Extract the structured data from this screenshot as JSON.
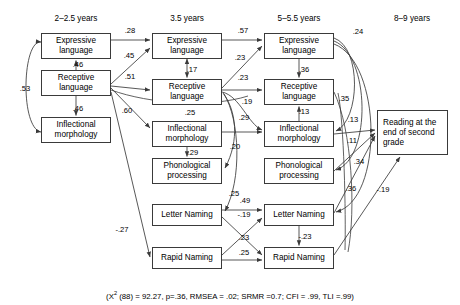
{
  "figure": {
    "type": "path-diagram",
    "columns": [
      {
        "id": "c1",
        "label": "2–2.5 years",
        "cx": 76
      },
      {
        "id": "c2",
        "label": "3.5 years",
        "cx": 187
      },
      {
        "id": "c3",
        "label": "5–5.5 years",
        "cx": 299
      },
      {
        "id": "c4",
        "label": "8–9 years",
        "cx": 412
      }
    ],
    "nodes": [
      {
        "id": "n1e",
        "label": "Expressive language",
        "x": 41,
        "y": 33,
        "w": 70,
        "h": 26,
        "col": "c1"
      },
      {
        "id": "n1r",
        "label": "Receptive language",
        "x": 41,
        "y": 70,
        "w": 70,
        "h": 26,
        "col": "c1"
      },
      {
        "id": "n1i",
        "label": "Inflectional morphology",
        "x": 41,
        "y": 117,
        "w": 70,
        "h": 26,
        "col": "c1"
      },
      {
        "id": "n2e",
        "label": "Expressive language",
        "x": 152,
        "y": 33,
        "w": 70,
        "h": 26,
        "col": "c2"
      },
      {
        "id": "n2r",
        "label": "Receptive language",
        "x": 152,
        "y": 79,
        "w": 70,
        "h": 26,
        "col": "c2"
      },
      {
        "id": "n2i",
        "label": "Inflectional morphology",
        "x": 152,
        "y": 121,
        "w": 70,
        "h": 26,
        "col": "c2"
      },
      {
        "id": "n2p",
        "label": "Phonological processing",
        "x": 152,
        "y": 158,
        "w": 70,
        "h": 26,
        "col": "c2"
      },
      {
        "id": "n2l",
        "label": "Letter Naming",
        "x": 152,
        "y": 204,
        "w": 70,
        "h": 22,
        "col": "c2"
      },
      {
        "id": "n2n",
        "label": "Rapid Naming",
        "x": 152,
        "y": 247,
        "w": 70,
        "h": 22,
        "col": "c2"
      },
      {
        "id": "n3e",
        "label": "Expressive language",
        "x": 264,
        "y": 33,
        "w": 70,
        "h": 26,
        "col": "c3"
      },
      {
        "id": "n3r",
        "label": "Receptive language",
        "x": 264,
        "y": 79,
        "w": 70,
        "h": 26,
        "col": "c3"
      },
      {
        "id": "n3i",
        "label": "Inflectional morphology",
        "x": 264,
        "y": 121,
        "w": 70,
        "h": 26,
        "col": "c3"
      },
      {
        "id": "n3p",
        "label": "Phonological processing",
        "x": 264,
        "y": 158,
        "w": 70,
        "h": 26,
        "col": "c3"
      },
      {
        "id": "n3l",
        "label": "Letter Naming",
        "x": 264,
        "y": 204,
        "w": 70,
        "h": 22,
        "col": "c3"
      },
      {
        "id": "n3n",
        "label": "Rapid Naming",
        "x": 264,
        "y": 247,
        "w": 70,
        "h": 22,
        "col": "c3"
      },
      {
        "id": "n4",
        "label": "Reading at the end of second grade",
        "x": 377,
        "y": 110,
        "w": 71,
        "h": 45,
        "col": "c4"
      }
    ],
    "paths": [
      {
        "from": "n1r",
        "to": "n1e",
        "coef": ".46",
        "lx": 74,
        "ly": 64,
        "style": "single"
      },
      {
        "from": "n1r",
        "to": "n1i",
        "coef": ".46",
        "lx": 74,
        "ly": 108,
        "style": "single"
      },
      {
        "from": "n1e",
        "to": "n1i",
        "coef": ".53",
        "lx": 25,
        "ly": 88,
        "style": "double-curve"
      },
      {
        "from": "n1e",
        "to": "n2e",
        "coef": ".28",
        "lx": 130,
        "ly": 30,
        "style": "straight"
      },
      {
        "from": "n1r",
        "to": "n2e",
        "coef": ".45",
        "lx": 129,
        "ly": 56,
        "style": "straight"
      },
      {
        "from": "n1r",
        "to": "n2r",
        "coef": ".51",
        "lx": 130,
        "ly": 77,
        "style": "straight"
      },
      {
        "from": "n1r",
        "to": "n2i",
        "coef": ".60",
        "lx": 127,
        "ly": 110,
        "style": "straight"
      },
      {
        "from": "n1r",
        "to": "n2n",
        "coef": ".25",
        "lx": 190,
        "ly": 112,
        "style": "curve"
      },
      {
        "from": "n1r",
        "to": "n2n",
        "coef": "-.27",
        "lx": 122,
        "ly": 229,
        "style": "straight"
      },
      {
        "from": "n2e",
        "to": "n2r",
        "coef": ".17",
        "lx": 191,
        "ly": 69,
        "style": "double"
      },
      {
        "from": "n2i",
        "to": "n2p",
        "coef": ".29",
        "lx": 192,
        "ly": 152,
        "style": "single"
      },
      {
        "from": "n2e",
        "to": "n3e",
        "coef": ".57",
        "lx": 243,
        "ly": 30,
        "style": "straight"
      },
      {
        "from": "n2r",
        "to": "n3e",
        "coef": ".23",
        "lx": 240,
        "ly": 57,
        "style": "straight"
      },
      {
        "from": "n2r",
        "to": "n3r",
        "coef": ".23",
        "lx": 243,
        "ly": 77,
        "style": "straight"
      },
      {
        "from": "n2r",
        "to": "n3i",
        "coef": ".19",
        "lx": 246,
        "ly": 101,
        "style": "curve"
      },
      {
        "from": "n2i",
        "to": "n3i",
        "coef": ".29",
        "lx": 243,
        "ly": 117,
        "style": "straight"
      },
      {
        "from": "n2r",
        "to": "n2p",
        "coef": ".20",
        "lx": 234,
        "ly": 146,
        "style": "curve"
      },
      {
        "from": "n2r",
        "to": "n2l",
        "coef": ".25",
        "lx": 233,
        "ly": 193,
        "style": "curve"
      },
      {
        "from": "n2l",
        "to": "n3l",
        "coef": ".49",
        "lx": 243,
        "ly": 199,
        "style": "straight"
      },
      {
        "from": "n2l",
        "to": "n3n",
        "coef": "-.19",
        "lx": 243,
        "ly": 213,
        "style": "straight"
      },
      {
        "from": "n2n",
        "to": "n3l",
        "coef": ".23",
        "lx": 243,
        "ly": 237,
        "style": "straight"
      },
      {
        "from": "n2n",
        "to": "n3n",
        "coef": ".25",
        "lx": 243,
        "ly": 252,
        "style": "straight"
      },
      {
        "from": "n3e",
        "to": "n3r",
        "coef": ".36",
        "lx": 303,
        "ly": 69,
        "style": "single"
      },
      {
        "from": "n3i",
        "to": "n3r",
        "coef": ".13",
        "lx": 303,
        "ly": 111,
        "style": "single"
      },
      {
        "from": "n3e",
        "to": "n3i",
        "coef": ".35",
        "lx": 343,
        "ly": 98,
        "style": "curve"
      },
      {
        "from": "n3e",
        "to": "n3p",
        "coef": ".24",
        "lx": 357,
        "ly": 31,
        "style": "curve"
      },
      {
        "from": "n3e",
        "to": "n3l",
        "coef": ".24b",
        "lx": 0,
        "ly": 0,
        "style": "curve"
      },
      {
        "from": "n3l",
        "to": "n3n",
        "coef": "-.23",
        "lx": 303,
        "ly": 236,
        "style": "single"
      },
      {
        "from": "n3i",
        "to": "n4",
        "coef": ".13",
        "lx": 352,
        "ly": 119,
        "style": "straight"
      },
      {
        "from": "n3p",
        "to": "n4",
        "coef": ".11",
        "lx": 351,
        "ly": 139,
        "style": "straight"
      },
      {
        "from": "n3l",
        "to": "n4",
        "coef": ".34",
        "lx": 358,
        "ly": 161,
        "style": "straight"
      },
      {
        "from": "n3r",
        "to": "n4",
        "coef": ".36",
        "lx": 350,
        "ly": 188,
        "style": "straight"
      },
      {
        "from": "n3n",
        "to": "n4",
        "coef": "-.19",
        "lx": 382,
        "ly": 189,
        "style": "straight"
      }
    ],
    "fit_statistics": "(X² (88) = 92.27, p=.36, RMSEA = .02; SRMR =0.7; CFI = .99, TLI =.99)",
    "fit_parts": {
      "prefix": "(X",
      "sup": "2",
      "rest": " (88) = 92.27, p=.36, RMSEA = .02; SRMR =0.7; CFI = .99, TLI =.99)"
    },
    "labels": {
      "l_46a": ".46",
      "l_46b": ".46",
      "l_53": ".53",
      "l_28": ".28",
      "l_45": ".45",
      "l_51": ".51",
      "l_60": ".60",
      "l_25a": ".25",
      "l_27": "-.27",
      "l_17": ".17",
      "l_29a": ".29",
      "l_57": ".57",
      "l_23a": ".23",
      "l_23b": ".23",
      "l_19a": ".19",
      "l_29b": ".29",
      "l_20": ".20",
      "l_25b": ".25",
      "l_49": ".49",
      "l_19b": "-.19",
      "l_23c": ".23",
      "l_25c": ".25",
      "l_36a": ".36",
      "l_13a": ".13",
      "l_35": ".35",
      "l_24": ".24",
      "l_23d": "-.23",
      "l_13b": ".13",
      "l_11": ".11",
      "l_34": ".34",
      "l_36b": ".36",
      "l_19c": "-.19"
    },
    "colors": {
      "stroke": "#3a3a3a",
      "text": "#000000",
      "background": "#ffffff"
    }
  }
}
